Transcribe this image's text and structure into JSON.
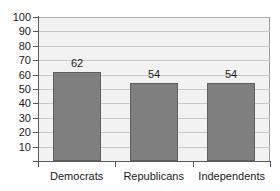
{
  "chart_data": {
    "type": "bar",
    "title": "",
    "subtitle": "",
    "xlabel": "",
    "ylabel": "",
    "categories": [
      "Democrats",
      "Republicans",
      "Independents"
    ],
    "values": [
      62,
      54,
      54
    ],
    "data_labels": [
      "62",
      "54",
      "54"
    ],
    "ylim": [
      0,
      100
    ],
    "ytick_step": 10,
    "ytick_labels": [
      "100",
      "90",
      "80",
      "70",
      "60",
      "50",
      "40",
      "30",
      "20",
      "10"
    ],
    "ytick_values": [
      100,
      90,
      80,
      70,
      60,
      50,
      40,
      30,
      20,
      10
    ],
    "grid": true,
    "grid_axis": "y",
    "legend": false,
    "legend_position": "none",
    "colors": {
      "bar_fill": "#7f7f7f",
      "bar_stroke": "#5e5e5e",
      "plot_background": "#f2f2f2",
      "gridline": "#c9c9c9",
      "axis": "#5a5a5a",
      "text": "#1a1a1a",
      "figure_background": "#ffffff"
    }
  }
}
